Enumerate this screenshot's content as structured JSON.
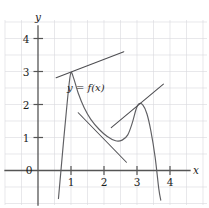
{
  "chart_data": {
    "type": "line",
    "title": "",
    "xlabel": "x",
    "ylabel": "y",
    "xlim": [
      -0.3,
      4.8
    ],
    "ylim": [
      -0.9,
      4.7
    ],
    "grid": true,
    "legend": null,
    "annotations": [
      {
        "text": "y = f(x)",
        "x": 1.45,
        "y": 2.42
      }
    ],
    "axis_labels": {
      "x": "x",
      "y": "y"
    },
    "xticks": [
      0,
      1,
      2,
      3,
      4
    ],
    "xtick_labels": [
      "0",
      "1",
      "2",
      "3",
      "4"
    ],
    "yticks": [
      1,
      2,
      3,
      4
    ],
    "ytick_labels": [
      "1",
      "2",
      "3",
      "4"
    ],
    "origin_label": "0",
    "series": [
      {
        "name": "y = f(x)",
        "type": "curve",
        "color": "#5f5f63",
        "points": [
          [
            0.62,
            -0.85
          ],
          [
            0.7,
            0.05
          ],
          [
            0.78,
            0.95
          ],
          [
            0.86,
            1.8
          ],
          [
            0.94,
            2.6
          ],
          [
            1.0,
            2.97
          ],
          [
            1.08,
            2.8
          ],
          [
            1.22,
            2.34
          ],
          [
            1.4,
            1.9
          ],
          [
            1.6,
            1.55
          ],
          [
            1.85,
            1.25
          ],
          [
            2.1,
            1.03
          ],
          [
            2.35,
            0.9
          ],
          [
            2.55,
            0.92
          ],
          [
            2.72,
            1.08
          ],
          [
            2.86,
            1.45
          ],
          [
            2.97,
            1.85
          ],
          [
            3.06,
            2.02
          ],
          [
            3.18,
            1.98
          ],
          [
            3.3,
            1.72
          ],
          [
            3.42,
            1.2
          ],
          [
            3.55,
            0.4
          ],
          [
            3.66,
            -0.55
          ],
          [
            3.72,
            -0.9
          ]
        ]
      },
      {
        "name": "tangent-at-peak-1",
        "type": "line",
        "color": "#4e4e52",
        "points": [
          [
            0.55,
            2.81
          ],
          [
            2.6,
            3.6
          ]
        ]
      },
      {
        "name": "secant-descending",
        "type": "line",
        "color": "#4e4e52",
        "points": [
          [
            1.22,
            1.75
          ],
          [
            2.68,
            0.25
          ]
        ]
      },
      {
        "name": "tangent-at-peak-2",
        "type": "line",
        "color": "#4e4e52",
        "points": [
          [
            2.22,
            1.3
          ],
          [
            3.8,
            2.62
          ]
        ]
      }
    ]
  },
  "figure": {
    "name": "graph-of-y-equals-f-of-x"
  }
}
